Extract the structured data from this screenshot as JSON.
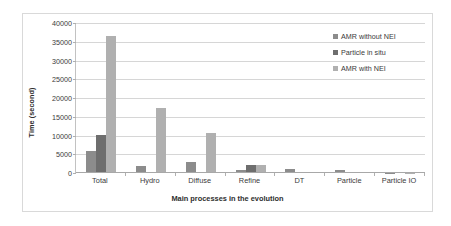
{
  "chart_data": {
    "type": "bar",
    "title": "",
    "xlabel": "Main processes in the evolution",
    "ylabel": "Time (second)",
    "categories": [
      "Total",
      "Hydro",
      "Diffuse",
      "Refine",
      "DT",
      "Particle",
      "Particle IO"
    ],
    "series": [
      {
        "name": "AMR without NEI",
        "color": "#8c8c8c",
        "values": [
          5800,
          1900,
          2850,
          800,
          1200,
          900,
          60
        ]
      },
      {
        "name": "Particle in situ",
        "color": "#6e6e6e",
        "values": [
          10200,
          0,
          0,
          2100,
          0,
          0,
          0
        ]
      },
      {
        "name": "AMR with NEI",
        "color": "#b0b0b0",
        "values": [
          36500,
          17400,
          10800,
          2150,
          250,
          0,
          80
        ]
      }
    ],
    "ylim": [
      0,
      40000
    ],
    "yticks": [
      0,
      5000,
      10000,
      15000,
      20000,
      25000,
      30000,
      35000,
      40000
    ],
    "ytick_labels": [
      "0",
      "5000",
      "10000",
      "15000",
      "20000",
      "25000",
      "30000",
      "35000",
      "40000"
    ],
    "grid": true,
    "legend_position": "top-right"
  },
  "legend": {
    "items": [
      {
        "label": "AMR without NEI",
        "icon": "legend-swatch-icon"
      },
      {
        "label": "Particle in situ",
        "icon": "legend-swatch-icon"
      },
      {
        "label": "AMR with NEI",
        "icon": "legend-swatch-icon"
      }
    ]
  }
}
